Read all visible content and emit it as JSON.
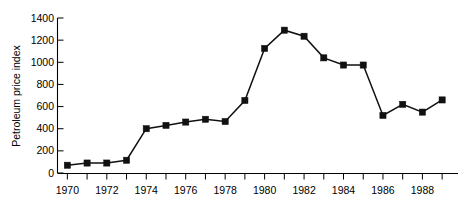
{
  "chart_data": {
    "type": "line",
    "title": "",
    "xlabel": "",
    "ylabel": "Petroleum price index",
    "x": [
      1970,
      1971,
      1972,
      1973,
      1974,
      1975,
      1976,
      1977,
      1978,
      1979,
      1980,
      1981,
      1982,
      1983,
      1984,
      1985,
      1986,
      1987,
      1988,
      1989
    ],
    "values": [
      70,
      90,
      90,
      115,
      400,
      430,
      460,
      485,
      465,
      655,
      1125,
      1290,
      1235,
      1040,
      975,
      975,
      520,
      620,
      550,
      660
    ],
    "series": [
      {
        "name": "Petroleum price index",
        "values": [
          70,
          90,
          90,
          115,
          400,
          430,
          460,
          485,
          465,
          655,
          1125,
          1290,
          1235,
          1040,
          975,
          975,
          520,
          620,
          550,
          660
        ]
      }
    ],
    "xlim": [
      1969.5,
      1989.5
    ],
    "ylim": [
      0,
      1400
    ],
    "xticks": [
      1970,
      1971,
      1972,
      1973,
      1974,
      1975,
      1976,
      1977,
      1978,
      1979,
      1980,
      1981,
      1982,
      1983,
      1984,
      1985,
      1986,
      1987,
      1988,
      1989
    ],
    "xtick_labels": [
      "1970",
      "",
      "1972",
      "",
      "1974",
      "",
      "1976",
      "",
      "1978",
      "",
      "1980",
      "",
      "1982",
      "",
      "1984",
      "",
      "1986",
      "",
      "1988",
      ""
    ],
    "yticks": [
      0,
      200,
      400,
      600,
      800,
      1000,
      1200,
      1400
    ],
    "ytick_labels": [
      "0",
      "200",
      "400",
      "600",
      "800",
      "1000",
      "1200",
      "1400"
    ],
    "grid": false,
    "legend": false,
    "marker": "square",
    "line_color": "#111111",
    "marker_color": "#111111"
  }
}
